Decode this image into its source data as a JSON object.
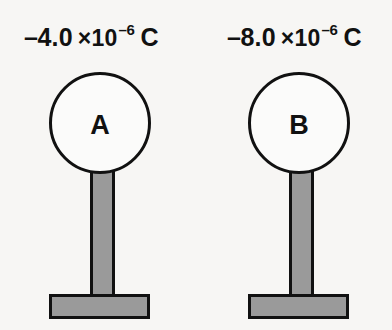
{
  "diagram": {
    "background_color": "#f7f6f4",
    "outline_color": "#111111",
    "stand_fill_color": "#9a9a9a",
    "sphere_fill_color": "#fbfbfa",
    "objects": [
      {
        "id": "a",
        "sphere_label": "A",
        "charge_sign": "–",
        "charge_mantissa": "4.0",
        "charge_times": "×10",
        "charge_exponent": "–6",
        "charge_unit": "C",
        "charge_text": "–4.0 ×10⁻⁶ C",
        "charge_value": -4e-06
      },
      {
        "id": "b",
        "sphere_label": "B",
        "charge_sign": "–",
        "charge_mantissa": "8.0",
        "charge_times": "×10",
        "charge_exponent": "–6",
        "charge_unit": "C",
        "charge_text": "–8.0 ×10⁻⁶ C",
        "charge_value": -8e-06
      }
    ]
  }
}
